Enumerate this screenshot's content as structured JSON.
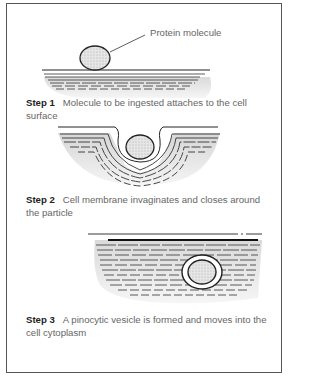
{
  "diagram": {
    "callout_label": "Protein molecule",
    "steps": [
      {
        "label": "Step 1",
        "text": "Molecule to be ingested attaches to the cell surface"
      },
      {
        "label": "Step 2",
        "text": "Cell membrane invaginates and closes around the particle"
      },
      {
        "label": "Step 3",
        "text": "A pinocytic vesicle is formed and moves into the cell cytoplasm"
      }
    ],
    "colors": {
      "border": "#555555",
      "ink": "#222222",
      "caption": "#666666",
      "hatch": "#777777",
      "molecule": "#dddddd"
    }
  }
}
